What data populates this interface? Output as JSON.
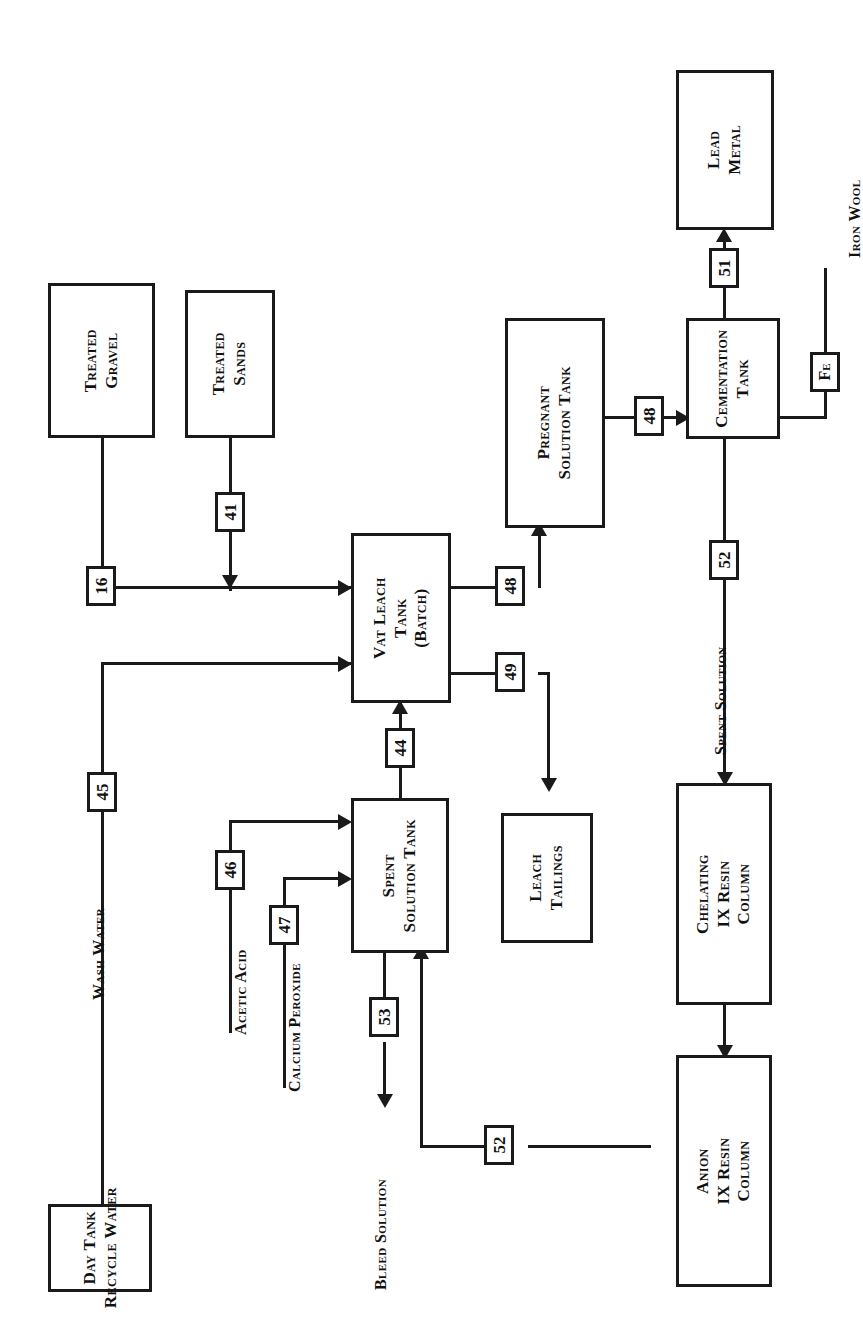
{
  "diagram": {
    "orientation": "rotated-90-ccw",
    "line_color": "#1a1a1a",
    "background_color": "#ffffff",
    "boxes": [
      {
        "id": "treated-gravel",
        "label": "Treated\nGravel"
      },
      {
        "id": "treated-sands",
        "label": "Treated\nSands"
      },
      {
        "id": "vat-leach-tank",
        "label": "Vat Leach\nTank\n(Batch)"
      },
      {
        "id": "pregnant-solution-tank",
        "label": "Pregnant\nSolution Tank"
      },
      {
        "id": "cementation-tank",
        "label": "Cementation\nTank"
      },
      {
        "id": "lead-metal",
        "label": "Lead\nMetal"
      },
      {
        "id": "spent-solution-tank",
        "label": "Spent\nSolution Tank"
      },
      {
        "id": "leach-tailings",
        "label": "Leach\nTailings"
      },
      {
        "id": "chelating-ix-resin-column",
        "label": "Chelating\nIX Resin\nColumn"
      },
      {
        "id": "anion-ix-resin-column",
        "label": "Anion\nIX Resin\nColumn"
      },
      {
        "id": "day-tank-recycle-water",
        "label": "Day Tank\nRecycle Water"
      }
    ],
    "stream_tags": [
      {
        "id": "tag-16",
        "value": "16"
      },
      {
        "id": "tag-41",
        "value": "41"
      },
      {
        "id": "tag-44",
        "value": "44"
      },
      {
        "id": "tag-45",
        "value": "45"
      },
      {
        "id": "tag-46",
        "value": "46"
      },
      {
        "id": "tag-47",
        "value": "47"
      },
      {
        "id": "tag-48-leach",
        "value": "48"
      },
      {
        "id": "tag-48-pregnant",
        "value": "48"
      },
      {
        "id": "tag-49",
        "value": "49"
      },
      {
        "id": "tag-51",
        "value": "51"
      },
      {
        "id": "tag-52-cementation",
        "value": "52"
      },
      {
        "id": "tag-52-anion",
        "value": "52"
      },
      {
        "id": "tag-53",
        "value": "53"
      },
      {
        "id": "tag-fe",
        "value": "Fe"
      }
    ],
    "flow_labels": [
      {
        "id": "iron-wool",
        "text": "Iron Wool"
      },
      {
        "id": "spent-solution",
        "text": "Spent Solution"
      },
      {
        "id": "wash-water",
        "text": "Wash Water"
      },
      {
        "id": "acetic-acid",
        "text": "Acetic Acid"
      },
      {
        "id": "calcium-peroxide",
        "text": "Calcium Peroxide"
      },
      {
        "id": "bleed-solution",
        "text": "Bleed Solution"
      }
    ]
  }
}
